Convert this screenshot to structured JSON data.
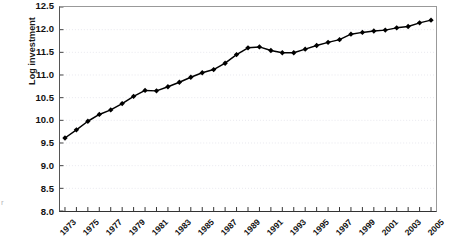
{
  "chart_data": {
    "type": "line",
    "title": "",
    "xlabel": "",
    "ylabel": "Log investment",
    "ylim": [
      8.0,
      12.5
    ],
    "ytick_labels": [
      "12.5",
      "12.0",
      "11.5",
      "11.0",
      "10.5",
      "10.0",
      "9.5",
      "9.0",
      "8.5",
      "8.0"
    ],
    "ytick_values": [
      12.5,
      12.0,
      11.5,
      11.0,
      10.5,
      10.0,
      9.5,
      9.0,
      8.5,
      8.0
    ],
    "grid": "horizontal-dotted",
    "legend": "none",
    "marker": "diamond",
    "line_color": "#000000",
    "marker_color": "#000000",
    "grid_color": "#e8e8ee",
    "x": [
      1973,
      1974,
      1975,
      1976,
      1977,
      1978,
      1979,
      1980,
      1981,
      1982,
      1983,
      1984,
      1985,
      1986,
      1987,
      1988,
      1989,
      1990,
      1991,
      1992,
      1993,
      1994,
      1995,
      1996,
      1997,
      1998,
      1999,
      2000,
      2001,
      2002,
      2003,
      2004,
      2005
    ],
    "xtick_labels": [
      "1973",
      "1975",
      "1977",
      "1979",
      "1981",
      "1983",
      "1985",
      "1987",
      "1989",
      "1991",
      "1993",
      "1995",
      "1997",
      "1999",
      "2001",
      "2003",
      "2005"
    ],
    "xtick_values": [
      1973,
      1975,
      1977,
      1979,
      1981,
      1983,
      1985,
      1987,
      1989,
      1991,
      1993,
      1995,
      1997,
      1999,
      2001,
      2003,
      2005
    ],
    "values": [
      9.61,
      9.79,
      9.98,
      10.13,
      10.23,
      10.37,
      10.53,
      10.66,
      10.65,
      10.74,
      10.84,
      10.95,
      11.05,
      11.12,
      11.26,
      11.45,
      11.6,
      11.62,
      11.54,
      11.49,
      11.49,
      11.57,
      11.65,
      11.72,
      11.78,
      11.9,
      11.94,
      11.97,
      11.99,
      12.04,
      12.07,
      12.15,
      12.21
    ],
    "series": [
      {
        "name": "Log investment",
        "values": [
          9.61,
          9.79,
          9.98,
          10.13,
          10.23,
          10.37,
          10.53,
          10.66,
          10.65,
          10.74,
          10.84,
          10.95,
          11.05,
          11.12,
          11.26,
          11.45,
          11.6,
          11.62,
          11.54,
          11.49,
          11.49,
          11.57,
          11.65,
          11.72,
          11.78,
          11.9,
          11.94,
          11.97,
          11.99,
          12.04,
          12.07,
          12.15,
          12.21
        ]
      }
    ]
  },
  "axes": {
    "y_title": "Log investment"
  },
  "artifact": {
    "text": "r"
  }
}
